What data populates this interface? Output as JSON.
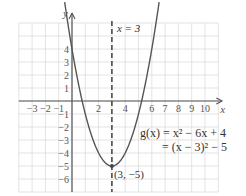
{
  "chart_data": {
    "type": "line",
    "title": "",
    "xlabel": "x",
    "ylabel": "y",
    "xlim": [
      -4,
      11
    ],
    "ylim": [
      -7,
      6
    ],
    "grid": true,
    "x_ticks": [
      -3,
      -2,
      -1,
      2,
      4,
      6,
      7,
      8,
      9,
      10
    ],
    "y_ticks": [
      4,
      3,
      2,
      1,
      -1,
      -2,
      -3,
      -4,
      -5,
      -6
    ],
    "series": [
      {
        "name": "g(x) = x² − 6x + 4",
        "function": "x^2 - 6x + 4",
        "x": [
          -0.5,
          0,
          1,
          2,
          3,
          4,
          5,
          6,
          6.5
        ],
        "y": [
          7.25,
          4,
          -1,
          -4,
          -5,
          -4,
          -1,
          4,
          7.25
        ]
      }
    ],
    "vertex": {
      "x": 3,
      "y": -5,
      "label": "(3, −5)"
    },
    "axis_of_symmetry": {
      "x": 3,
      "label": "x = 3",
      "style": "dashed"
    },
    "annotations": {
      "equation_line1": "g(x) = x² − 6x + 4",
      "equation_line2": "= (x − 3)² − 5"
    },
    "colors": {
      "curve": "#555555",
      "axes": "#555555",
      "grid": "#d8d8d8",
      "dashed": "#333333"
    }
  }
}
